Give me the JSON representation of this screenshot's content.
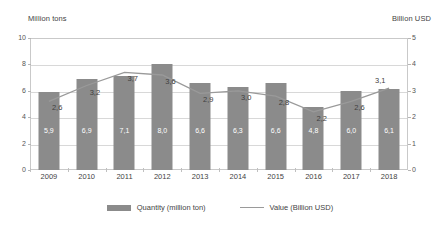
{
  "chart_data": {
    "type": "bar",
    "title": "",
    "categories": [
      "2009",
      "2010",
      "2011",
      "2012",
      "2013",
      "2014",
      "2015",
      "2016",
      "2017",
      "2018"
    ],
    "series": [
      {
        "name": "Quantity (million ton)",
        "type": "bar",
        "axis": "left",
        "values": [
          5.9,
          6.9,
          7.1,
          8.0,
          6.6,
          6.3,
          6.6,
          4.8,
          6.0,
          6.1
        ],
        "labels": [
          "5,9",
          "6,9",
          "7,1",
          "8,0",
          "6,6",
          "6,3",
          "6,6",
          "4,8",
          "6,0",
          "6,1"
        ],
        "color": "#8b8b8b"
      },
      {
        "name": "Value (Billion USD)",
        "type": "line",
        "axis": "right",
        "values": [
          2.6,
          3.2,
          3.7,
          3.6,
          2.9,
          3.0,
          2.8,
          2.2,
          2.6,
          3.1
        ],
        "labels": [
          "2,6",
          "3,2",
          "3,7",
          "3,6",
          "2,9",
          "3,0",
          "2,8",
          "2,2",
          "2,6",
          "3,1"
        ],
        "color": "#9a9a9a"
      }
    ],
    "left_axis": {
      "title": "Million tons",
      "ticks": [
        "10",
        "8",
        "6",
        "4",
        "2",
        "0"
      ],
      "values": [
        10,
        8,
        6,
        4,
        2,
        0
      ],
      "ylim": [
        0,
        10
      ]
    },
    "right_axis": {
      "title": "Billion USD",
      "ticks": [
        "5",
        "4",
        "3",
        "2",
        "1",
        "0"
      ],
      "values": [
        5,
        4,
        3,
        2,
        1,
        0
      ],
      "ylim": [
        0,
        5
      ]
    },
    "xlabel": "",
    "grid": true,
    "legend": {
      "position": "bottom",
      "entries": [
        {
          "label": "Quantity (million ton)",
          "marker": "bar-swatch"
        },
        {
          "label": "Value (Billion USD)",
          "marker": "line-swatch"
        }
      ]
    }
  }
}
